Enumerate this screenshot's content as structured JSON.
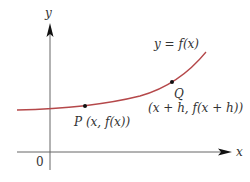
{
  "figure": {
    "type": "function-graph-secant-setup",
    "colors": {
      "axis": "#666666",
      "curve": "#b5484a",
      "point": "#111111",
      "text": "#333333"
    },
    "axes": {
      "x_label": "x",
      "y_label": "y",
      "origin_label": "0"
    },
    "curve": {
      "label": "y = f(x)",
      "shape": "increasing, concave up"
    },
    "points": [
      {
        "name": "P",
        "label": "P (x, f(x))"
      },
      {
        "name": "Q",
        "label": "Q",
        "coords_label": "(x + h, f(x + h))"
      }
    ]
  }
}
